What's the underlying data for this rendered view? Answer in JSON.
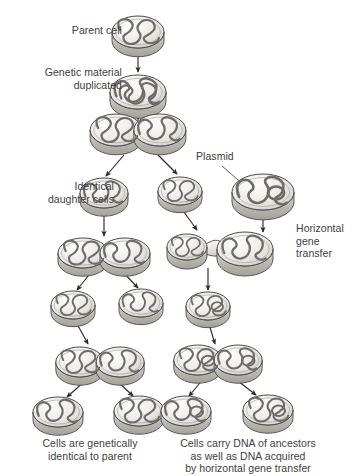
{
  "diagram": {
    "labels": {
      "parent_cell": "Parent cell",
      "genetic_material_duplicated": "Genetic material\nduplicated",
      "identical_daughter_cells": "Identical\ndaughter cells",
      "plasmid": "Plasmid",
      "horizontal_gene_transfer": "Horizontal\ngene\ntransfer"
    },
    "captions": {
      "left": "Cells are genetically\nidentical to parent",
      "right": "Cells carry DNA of ancestors\nas well as DNA acquired\nby horizontal gene transfer"
    },
    "colors": {
      "cell_fill_light": "#f2f1ee",
      "cell_fill_mid": "#d9d7d2",
      "cell_side": "#bfbcb6",
      "outline": "#4a4a4a",
      "dna": "#6b6b6b",
      "arrow": "#2e2e2e",
      "text": "#3d3d3d",
      "background": "#ffffff"
    },
    "cells": [
      {
        "id": "parent",
        "name": "parent-cell",
        "x": 138,
        "y": 32,
        "rx": 26,
        "ry": 16,
        "dna": "single",
        "plasmid": false
      },
      {
        "id": "duplicated",
        "name": "duplicated-cell",
        "x": 138,
        "y": 92,
        "rx": 28,
        "ry": 17,
        "dna": "double",
        "plasmid": false
      },
      {
        "id": "division1",
        "name": "dividing-cell-first",
        "x": 138,
        "y": 130,
        "rx": 26,
        "ry": 16,
        "dna": "double",
        "plasmid": false,
        "paired": true
      },
      {
        "id": "daughter-left",
        "name": "daughter-cell-left",
        "x": 104,
        "y": 193,
        "rx": 24,
        "ry": 15,
        "dna": "single",
        "plasmid": false
      },
      {
        "id": "daughter-right",
        "name": "daughter-cell-right",
        "x": 180,
        "y": 191,
        "rx": 22,
        "ry": 14,
        "dna": "single",
        "plasmid": false
      },
      {
        "id": "plasmid-donor",
        "name": "plasmid-donor-cell",
        "x": 263,
        "y": 192,
        "rx": 31,
        "ry": 18,
        "dna": "single",
        "plasmid": true
      },
      {
        "id": "division2-left",
        "name": "dividing-cell-left-second",
        "x": 104,
        "y": 253,
        "rx": 25,
        "ry": 15,
        "dna": "double",
        "plasmid": false,
        "paired": true
      },
      {
        "id": "conjugation",
        "name": "conjugating-cell-pair",
        "x": 205,
        "y": 247,
        "rx": 23,
        "ry": 14,
        "dna": "single",
        "plasmid": true,
        "conjugation": true
      },
      {
        "id": "clone-l1",
        "name": "clone-cell-left-upper",
        "x": 73,
        "y": 305,
        "rx": 22,
        "ry": 14,
        "dna": "single",
        "plasmid": false
      },
      {
        "id": "clone-l2",
        "name": "clone-cell-right-upper",
        "x": 141,
        "y": 303,
        "rx": 22,
        "ry": 14,
        "dna": "single",
        "plasmid": false
      },
      {
        "id": "hgt-cell",
        "name": "transconjugant-cell",
        "x": 208,
        "y": 306,
        "rx": 22,
        "ry": 14,
        "dna": "single",
        "plasmid": true
      },
      {
        "id": "division3-left",
        "name": "dividing-cell-left-third",
        "x": 100,
        "y": 362,
        "rx": 24,
        "ry": 15,
        "dna": "double",
        "plasmid": false,
        "paired": true
      },
      {
        "id": "division3-right",
        "name": "dividing-cell-right-third",
        "x": 218,
        "y": 360,
        "rx": 24,
        "ry": 15,
        "dna": "double",
        "plasmid": true,
        "paired": true
      },
      {
        "id": "final-l1",
        "name": "final-cell-left-1",
        "x": 58,
        "y": 412,
        "rx": 25,
        "ry": 15,
        "dna": "single",
        "plasmid": false
      },
      {
        "id": "final-l2",
        "name": "final-cell-left-2",
        "x": 139,
        "y": 411,
        "rx": 25,
        "ry": 15,
        "dna": "single",
        "plasmid": false
      },
      {
        "id": "final-r1",
        "name": "final-cell-right-1",
        "x": 186,
        "y": 411,
        "rx": 25,
        "ry": 15,
        "dna": "single",
        "plasmid": true
      },
      {
        "id": "final-r2",
        "name": "final-cell-right-2",
        "x": 268,
        "y": 410,
        "rx": 25,
        "ry": 15,
        "dna": "single",
        "plasmid": true
      }
    ],
    "arrows": [
      {
        "name": "arrow-parent-to-duplicated",
        "x1": 138,
        "y1": 50,
        "x2": 138,
        "y2": 72
      },
      {
        "name": "arrow-duplicated-to-division",
        "x1": 138,
        "y1": 112,
        "x2": 138,
        "y2": 134
      },
      {
        "name": "arrow-division-to-daughter-l",
        "x1": 124,
        "y1": 155,
        "x2": 106,
        "y2": 176
      },
      {
        "name": "arrow-division-to-daughter-r",
        "x1": 158,
        "y1": 155,
        "x2": 177,
        "y2": 174
      },
      {
        "name": "arrow-daughter-l-to-div2",
        "x1": 104,
        "y1": 211,
        "x2": 104,
        "y2": 236
      },
      {
        "name": "arrow-daughter-r-to-conj",
        "x1": 181,
        "y1": 208,
        "x2": 197,
        "y2": 230
      },
      {
        "name": "arrow-plasmid-donor-to-conj",
        "x1": 263,
        "y1": 213,
        "x2": 263,
        "y2": 232
      },
      {
        "name": "arrow-div2-to-clone-l1",
        "x1": 92,
        "y1": 271,
        "x2": 77,
        "y2": 290
      },
      {
        "name": "arrow-div2-to-clone-l2",
        "x1": 122,
        "y1": 271,
        "x2": 138,
        "y2": 288
      },
      {
        "name": "arrow-conj-to-hgt-cell",
        "x1": 208,
        "y1": 268,
        "x2": 208,
        "y2": 290
      },
      {
        "name": "arrow-clone-l1-to-div3",
        "x1": 76,
        "y1": 322,
        "x2": 88,
        "y2": 344
      },
      {
        "name": "arrow-hgt-to-div3r",
        "x1": 209,
        "y1": 324,
        "x2": 215,
        "y2": 344
      },
      {
        "name": "arrow-div3l-to-final-1",
        "x1": 86,
        "y1": 380,
        "x2": 67,
        "y2": 397
      },
      {
        "name": "arrow-div3l-to-final-2",
        "x1": 116,
        "y1": 380,
        "x2": 133,
        "y2": 396
      },
      {
        "name": "arrow-div3r-to-final-1",
        "x1": 204,
        "y1": 378,
        "x2": 189,
        "y2": 396
      },
      {
        "name": "arrow-div3r-to-final-2",
        "x1": 234,
        "y1": 378,
        "x2": 256,
        "y2": 395
      }
    ],
    "leader_lines": [
      {
        "name": "leader-plasmid-label",
        "x1": 222,
        "y1": 166,
        "x2": 245,
        "y2": 186
      }
    ]
  }
}
